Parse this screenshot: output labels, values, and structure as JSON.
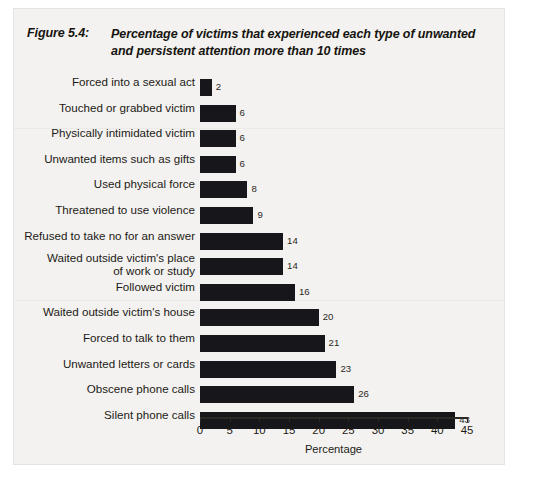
{
  "figure": {
    "number_label": "Figure 5.4:",
    "title": "Percentage of victims that experienced each type of unwanted and persistent attention more than 10 times"
  },
  "axis": {
    "x_title": "Percentage",
    "ticks": [
      "0",
      "5",
      "10",
      "15",
      "20",
      "25",
      "30",
      "35",
      "40",
      "45"
    ]
  },
  "colors": {
    "bar": "#17161a",
    "page": "#f3f2f0",
    "text": "#1c1a16"
  },
  "chart_data": {
    "type": "bar",
    "orientation": "horizontal",
    "title": "Percentage of victims that experienced each type of unwanted and persistent attention more than 10 times",
    "xlabel": "Percentage",
    "ylabel": "",
    "xlim": [
      0,
      45
    ],
    "xticks": [
      0,
      5,
      10,
      15,
      20,
      25,
      30,
      35,
      40,
      45
    ],
    "grid": false,
    "legend": null,
    "categories": [
      "Forced into a sexual act",
      "Touched or grabbed victim",
      "Physically intimidated victim",
      "Unwanted items such as gifts",
      "Used physical force",
      "Threatened to use violence",
      "Refused to take no for an answer",
      "Waited outside victim's place\nof work or study",
      "Followed victim",
      "Waited outside victim's house",
      "Forced to talk to them",
      "Unwanted letters or cards",
      "Obscene phone calls",
      "Silent phone calls"
    ],
    "values": [
      2,
      6,
      6,
      6,
      8,
      9,
      14,
      14,
      16,
      20,
      21,
      23,
      26,
      43
    ],
    "value_labels": [
      "2",
      "6",
      "6",
      "6",
      "8",
      "9",
      "14",
      "14",
      "16",
      "20",
      "21",
      "23",
      "26",
      "43"
    ]
  }
}
